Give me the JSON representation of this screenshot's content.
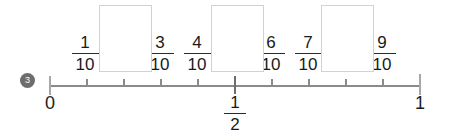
{
  "problem": {
    "number": "3",
    "badge_color": "#6d6d6d",
    "badge_text_color": "#ffffff"
  },
  "numberline": {
    "line_color": "#8a8a8a",
    "tick_color": "#8a8a8a",
    "start_label": "0",
    "end_label": "1",
    "midpoint_label_numerator": "1",
    "midpoint_label_denominator": "2",
    "divisions": 10,
    "ticks": [
      {
        "index": 0,
        "value": "0",
        "kind": "endpoint"
      },
      {
        "index": 1,
        "value": "1/10",
        "kind": "minor"
      },
      {
        "index": 2,
        "value": "2/10",
        "kind": "minor"
      },
      {
        "index": 3,
        "value": "3/10",
        "kind": "minor"
      },
      {
        "index": 4,
        "value": "4/10",
        "kind": "minor"
      },
      {
        "index": 5,
        "value": "5/10",
        "kind": "major"
      },
      {
        "index": 6,
        "value": "6/10",
        "kind": "minor"
      },
      {
        "index": 7,
        "value": "7/10",
        "kind": "minor"
      },
      {
        "index": 8,
        "value": "8/10",
        "kind": "minor"
      },
      {
        "index": 9,
        "value": "9/10",
        "kind": "minor"
      },
      {
        "index": 10,
        "value": "1",
        "kind": "endpoint"
      }
    ]
  },
  "fraction_labels": [
    {
      "tick": 1,
      "numerator": "1",
      "denominator": "10"
    },
    {
      "tick": 3,
      "numerator": "3",
      "denominator": "10"
    },
    {
      "tick": 4,
      "numerator": "4",
      "denominator": "10"
    },
    {
      "tick": 6,
      "numerator": "6",
      "denominator": "10"
    },
    {
      "tick": 7,
      "numerator": "7",
      "denominator": "10"
    },
    {
      "tick": 9,
      "numerator": "9",
      "denominator": "10"
    }
  ],
  "answer_boxes": [
    {
      "tick": 2,
      "value": "",
      "placeholder": ""
    },
    {
      "tick": 5,
      "value": "",
      "placeholder": ""
    },
    {
      "tick": 8,
      "value": "",
      "placeholder": ""
    }
  ]
}
